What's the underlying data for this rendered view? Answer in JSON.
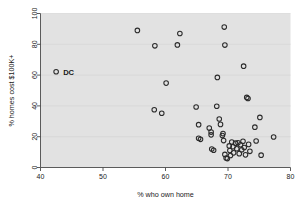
{
  "chart_data": {
    "type": "scatter",
    "title": "",
    "xlabel": "% who own home",
    "ylabel": "% homes cost $100K+",
    "xlim": [
      40,
      80
    ],
    "ylim": [
      0,
      100
    ],
    "xticks": [
      40,
      50,
      60,
      70,
      80
    ],
    "yticks": [
      0,
      20,
      40,
      60,
      80,
      100
    ],
    "grid": "horizontal",
    "legend": "none",
    "marker": "open-circle",
    "annotations": [
      {
        "label": "DC",
        "x": 42.5,
        "y": 62
      }
    ],
    "points": [
      {
        "x": 42.5,
        "y": 62.2
      },
      {
        "x": 55.5,
        "y": 89.0
      },
      {
        "x": 58.3,
        "y": 79.0
      },
      {
        "x": 58.2,
        "y": 37.5
      },
      {
        "x": 59.4,
        "y": 35.2
      },
      {
        "x": 60.1,
        "y": 54.8
      },
      {
        "x": 61.9,
        "y": 79.6
      },
      {
        "x": 62.3,
        "y": 87.0
      },
      {
        "x": 64.9,
        "y": 39.3
      },
      {
        "x": 65.3,
        "y": 27.8
      },
      {
        "x": 65.3,
        "y": 19.0
      },
      {
        "x": 65.6,
        "y": 18.3
      },
      {
        "x": 67.0,
        "y": 25.6
      },
      {
        "x": 67.3,
        "y": 23.0
      },
      {
        "x": 67.3,
        "y": 21.2
      },
      {
        "x": 67.4,
        "y": 12.0
      },
      {
        "x": 67.7,
        "y": 11.2
      },
      {
        "x": 68.2,
        "y": 39.8
      },
      {
        "x": 68.3,
        "y": 58.5
      },
      {
        "x": 68.6,
        "y": 31.5
      },
      {
        "x": 68.8,
        "y": 28.0
      },
      {
        "x": 69.1,
        "y": 20.8
      },
      {
        "x": 69.2,
        "y": 22.0
      },
      {
        "x": 69.3,
        "y": 17.5
      },
      {
        "x": 69.4,
        "y": 91.2
      },
      {
        "x": 69.5,
        "y": 79.5
      },
      {
        "x": 69.5,
        "y": 8.5
      },
      {
        "x": 69.7,
        "y": 6.2
      },
      {
        "x": 69.9,
        "y": 5.8
      },
      {
        "x": 70.2,
        "y": 14.0
      },
      {
        "x": 70.3,
        "y": 11.0
      },
      {
        "x": 70.4,
        "y": 7.8
      },
      {
        "x": 70.6,
        "y": 16.5
      },
      {
        "x": 70.8,
        "y": 13.5
      },
      {
        "x": 70.9,
        "y": 9.5
      },
      {
        "x": 71.2,
        "y": 15.8
      },
      {
        "x": 71.4,
        "y": 12.2
      },
      {
        "x": 71.6,
        "y": 16.0
      },
      {
        "x": 71.8,
        "y": 9.0
      },
      {
        "x": 72.0,
        "y": 14.8
      },
      {
        "x": 72.2,
        "y": 11.5
      },
      {
        "x": 72.4,
        "y": 17.0
      },
      {
        "x": 72.5,
        "y": 65.8
      },
      {
        "x": 72.6,
        "y": 13.0
      },
      {
        "x": 72.8,
        "y": 8.2
      },
      {
        "x": 73.0,
        "y": 45.5
      },
      {
        "x": 73.2,
        "y": 44.8
      },
      {
        "x": 73.3,
        "y": 15.0
      },
      {
        "x": 73.5,
        "y": 10.5
      },
      {
        "x": 74.3,
        "y": 26.2
      },
      {
        "x": 74.5,
        "y": 17.2
      },
      {
        "x": 75.1,
        "y": 32.5
      },
      {
        "x": 75.3,
        "y": 8.0
      },
      {
        "x": 77.3,
        "y": 19.8
      }
    ]
  },
  "style": {
    "plot_background": "#e2e2e2",
    "page_background": "#ffffff",
    "marker_stroke": "#2b2b2b",
    "gridline_color": "#d2d2d2",
    "axis_color": "#4a4a4a"
  }
}
